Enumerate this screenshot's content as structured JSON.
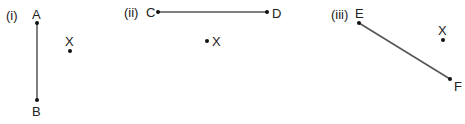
{
  "panels": [
    {
      "label": "(i)",
      "segment": {
        "start": "A",
        "end": "B"
      },
      "point": "X"
    },
    {
      "label": "(ii)",
      "segment": {
        "start": "C",
        "end": "D"
      },
      "point": "X"
    },
    {
      "label": "(iii)",
      "segment": {
        "start": "E",
        "end": "F"
      },
      "point": "X"
    }
  ],
  "colors": {
    "line": "#555555",
    "text": "#222222"
  }
}
